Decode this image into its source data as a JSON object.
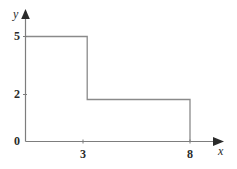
{
  "figure": {
    "background_color": "#ffffff",
    "line_color": "#8a8a8a",
    "axis_color": "#7d7d7d",
    "text_color": "#2b2b2b"
  },
  "axes": {
    "x_axis_label": "x",
    "y_axis_label": "y",
    "x_ticks": [
      "3",
      "8"
    ],
    "y_ticks": [
      "0",
      "2",
      "5"
    ],
    "origin_label": "0"
  },
  "chart_data": {
    "type": "line",
    "title": "",
    "xlabel": "x",
    "ylabel": "y",
    "xlim": [
      0,
      9.5
    ],
    "ylim": [
      0,
      6
    ],
    "grid": false,
    "legend": null,
    "xticks": [
      3,
      8
    ],
    "yticks": [
      0,
      2,
      5
    ],
    "xtick_labels": [
      "3",
      "8"
    ],
    "ytick_labels": [
      "0",
      "2",
      "5"
    ],
    "series": [
      {
        "name": "step function",
        "style": "step-post",
        "closed_to_axis": true,
        "x": [
          0,
          3,
          3,
          8,
          8
        ],
        "y": [
          5,
          5,
          2,
          2,
          0
        ],
        "segments": [
          {
            "from": [
              0,
              5
            ],
            "to": [
              3,
              5
            ],
            "orientation": "horizontal"
          },
          {
            "from": [
              3,
              5
            ],
            "to": [
              3,
              2
            ],
            "orientation": "vertical"
          },
          {
            "from": [
              3,
              2
            ],
            "to": [
              8,
              2
            ],
            "orientation": "horizontal"
          },
          {
            "from": [
              8,
              2
            ],
            "to": [
              8,
              0
            ],
            "orientation": "vertical"
          },
          {
            "from": [
              0,
              0
            ],
            "to": [
              0,
              5
            ],
            "orientation": "vertical"
          }
        ]
      }
    ]
  }
}
